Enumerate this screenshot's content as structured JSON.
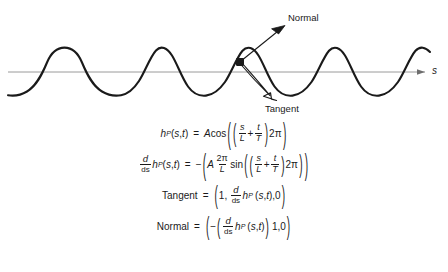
{
  "figure": {
    "type": "diagram",
    "background_color": "#ffffff",
    "curve_color": "#1a1a1a",
    "axis_color": "#9a9a9a",
    "text_color": "#1a1a1a"
  },
  "diagram": {
    "axis": {
      "label": "s",
      "description": "horizontal arc-length axis pointing right",
      "y_position": 72,
      "x_start": 8,
      "x_end": 425
    },
    "wave": {
      "description": "cosine-like wave, three peaks, amplitude 24 px, wavelength 137 px",
      "amplitude_px": 24,
      "wavelength_px": 137,
      "baseline_y": 72
    },
    "point_marker": {
      "name": "point-P",
      "x": 240,
      "y": 62
    },
    "vectors": [
      {
        "name": "normal",
        "label": "Normal",
        "from": [
          240,
          62
        ],
        "to": [
          285,
          26
        ]
      },
      {
        "name": "tangent",
        "label": "Tangent",
        "from": [
          240,
          62
        ],
        "to": [
          276,
          101
        ]
      }
    ],
    "labels": {
      "normal": "Normal",
      "tangent": "Tangent",
      "axis_s": "s"
    }
  },
  "equations": [
    {
      "id": "height-function",
      "plain": "h_P(s,t) = A cos( ( s/L + t/T ) 2π )",
      "lhs": "h_P(s,t)",
      "rhs": "A cos(((s/L)+(t/T))2π)"
    },
    {
      "id": "derivative",
      "plain": "d/ds h_P(s,t) = −( A (2π/L) sin( ( s/L + t/T ) 2π ) )",
      "lhs": "d/ds h_P(s,t)",
      "rhs": "−(A (2π/L) sin(((s/L)+(t/T))2π))"
    },
    {
      "id": "tangent-vector",
      "plain": "Tangent = (1, d/ds h_P(s,t), 0)",
      "lhs": "Tangent",
      "rhs": "(1, d/ds h_P(s,t), 0)"
    },
    {
      "id": "normal-vector",
      "plain": "Normal = ( −( d/ds h_P(s,t) ) 1, 0 )",
      "lhs": "Normal",
      "rhs": "(−(d/ds h_P(s,t)) 1, 0)"
    }
  ],
  "symbols": {
    "h": "h",
    "P": "P",
    "s": "s",
    "t": "t",
    "A": "A",
    "L": "L",
    "T": "T",
    "cos": "cos",
    "sin": "sin",
    "d": "d",
    "ds": "ds",
    "two": "2",
    "pi": "π",
    "one": "1",
    "zero": "0",
    "comma": ",",
    "equals": "=",
    "plus": "+",
    "minus": "−",
    "lparen": "(",
    "rparen": ")",
    "tangent_word": "Tangent",
    "normal_word": "Normal"
  },
  "caption": {
    "text": ""
  }
}
